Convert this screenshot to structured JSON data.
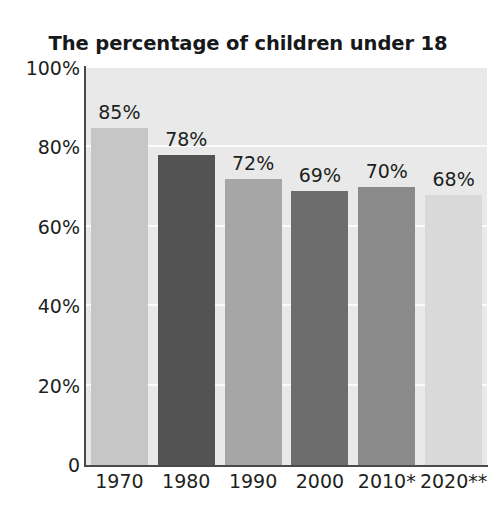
{
  "chart_data": {
    "type": "bar",
    "title": "The percentage of children under 18\nwho live with both parents",
    "title_line1": "The percentage of children under 18",
    "title_line2": "who live with both parents",
    "xlabel": "",
    "ylabel": "",
    "ylim": [
      0,
      100
    ],
    "grid": true,
    "legend": "none",
    "categories": [
      "1970",
      "1980",
      "1990",
      "2000",
      "2010*",
      "2020**"
    ],
    "values": [
      85,
      78,
      72,
      69,
      70,
      68
    ],
    "value_labels": [
      "85%",
      "78%",
      "72%",
      "69%",
      "70%",
      "68%"
    ],
    "bar_colors": [
      "#c6c6c6",
      "#535353",
      "#a6a6a6",
      "#6d6d6d",
      "#8a8a8a",
      "#d9d9d9"
    ],
    "ytick_labels": [
      "100%",
      "80%",
      "60%",
      "40%",
      "20%",
      "0"
    ],
    "ytick_values": [
      100,
      80,
      60,
      40,
      20,
      0
    ],
    "plot_background": "#e9e9e9",
    "gridline_color": "#fbfbfb",
    "axis_color": "#4a4a4a",
    "text_color": "#1d1f21",
    "footnote_markers": [
      "*",
      "**"
    ]
  }
}
